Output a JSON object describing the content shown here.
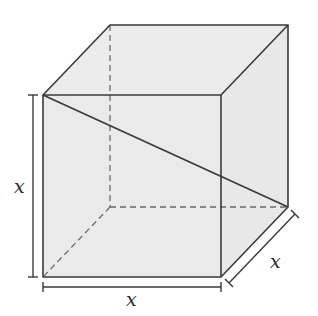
{
  "figure": {
    "type": "cube-space-diagonal",
    "colors": {
      "face_fill": "#ebebeb",
      "edge": "#3a3a3a",
      "hidden_edge": "#6a6a6a",
      "label": "#2a2a2a"
    },
    "labels": {
      "height": "x",
      "width": "x",
      "depth": "x"
    }
  }
}
